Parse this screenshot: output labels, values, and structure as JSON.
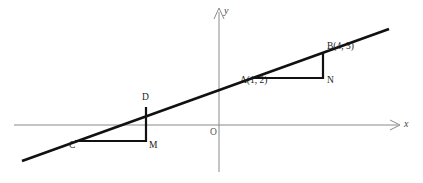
{
  "figure": {
    "background_color": "#ffffff",
    "line_color": "#111111",
    "axis_color": "#8a8a8a",
    "label_color": "#1a1a1a"
  },
  "axes": {
    "x_label": "x",
    "y_label": "y",
    "origin_label": "O",
    "x_axis": {
      "x1": 14,
      "y1": 125,
      "x2": 398,
      "y2": 125
    },
    "y_axis": {
      "x1": 219,
      "y1": 10,
      "x2": 219,
      "y2": 172
    },
    "x_arrow": {
      "x": 398,
      "y": 125
    },
    "y_arrow": {
      "x": 219,
      "y": 10
    }
  },
  "line": {
    "name": "main-line",
    "x1": 22,
    "y1": 161,
    "x2": 389,
    "y2": 29
  },
  "points": [
    {
      "id": "A",
      "label": "A(1, 2)",
      "x": 253,
      "y": 78,
      "label_x": 240,
      "label_y": 81
    },
    {
      "id": "B",
      "label": "B(4, 3)",
      "x": 323,
      "y": 53,
      "label_x": 327,
      "label_y": 47
    },
    {
      "id": "N",
      "label": "N",
      "x": 323,
      "y": 78,
      "label_x": 327,
      "label_y": 80
    },
    {
      "id": "C",
      "label": "C",
      "x": 76,
      "y": 141,
      "label_x": 70,
      "label_y": 143
    },
    {
      "id": "D",
      "label": "D",
      "x": 146,
      "y": 108,
      "label_x": 143,
      "label_y": 96
    },
    {
      "id": "M",
      "label": "M",
      "x": 146,
      "y": 141,
      "label_x": 150,
      "label_y": 143
    }
  ],
  "triangles": [
    {
      "name": "upper-slope-triangle",
      "vertices": "A-N-B",
      "horizontal_leg": {
        "x1": 253,
        "y1": 78,
        "x2": 323,
        "y2": 78
      },
      "vertical_leg": {
        "x1": 323,
        "y1": 78,
        "x2": 323,
        "y2": 53
      }
    },
    {
      "name": "lower-slope-triangle",
      "vertices": "C-M-D",
      "horizontal_leg": {
        "x1": 76,
        "y1": 141,
        "x2": 146,
        "y2": 141
      },
      "vertical_leg": {
        "x1": 146,
        "y1": 141,
        "x2": 146,
        "y2": 108
      }
    }
  ]
}
